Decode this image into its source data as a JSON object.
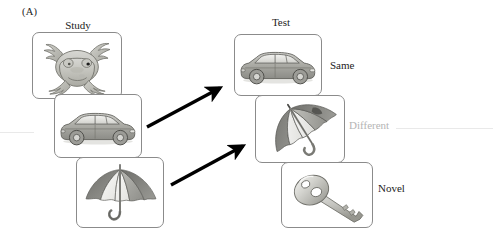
{
  "figure": {
    "panel_label": "(A)",
    "columns": [
      {
        "name": "study",
        "header": "Study"
      },
      {
        "name": "test",
        "header": "Test"
      }
    ],
    "study_cards": [
      {
        "id": "study-frog",
        "icon": "frog-icon",
        "alt": "frog"
      },
      {
        "id": "study-car",
        "icon": "car-icon",
        "alt": "car"
      },
      {
        "id": "study-umbrella",
        "icon": "umbrella-icon",
        "alt": "umbrella"
      }
    ],
    "test_cards": [
      {
        "id": "test-car",
        "icon": "car-icon",
        "alt": "car"
      },
      {
        "id": "test-umbrella",
        "icon": "umbrella-rotated-icon",
        "alt": "umbrella rotated"
      },
      {
        "id": "test-key",
        "icon": "key-icon",
        "alt": "key"
      }
    ],
    "condition_labels": [
      {
        "id": "same",
        "text": "Same",
        "color": "#232323",
        "faded": false
      },
      {
        "id": "different",
        "text": "Different",
        "color": "#b4b4b4",
        "faded": true
      },
      {
        "id": "novel",
        "text": "Novel",
        "color": "#232323",
        "faded": false
      }
    ],
    "arrows": [
      {
        "id": "arrow-study-car-to-test-car",
        "from": "study-car",
        "to": "test-car"
      },
      {
        "id": "arrow-study-umbrella-to-test-umbrella",
        "from": "study-umbrella",
        "to": "test-umbrella"
      }
    ],
    "colors": {
      "card_border": "#8b8b8b",
      "arrow": "#000000",
      "background": "#ffffff",
      "text": "#232323",
      "faded_text": "#b4b4b4"
    }
  }
}
